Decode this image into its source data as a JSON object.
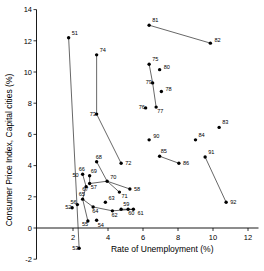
{
  "chart_data": {
    "type": "scatter",
    "title": "",
    "xlabel": "Rate of Unemployment (%)",
    "ylabel": "Consumer Price Index, Capital cities (%)",
    "xlim": [
      0,
      12.6
    ],
    "ylim": [
      -2,
      14
    ],
    "xticks": [
      2,
      4,
      6,
      8,
      10,
      12
    ],
    "yticks": [
      -2,
      0,
      2,
      4,
      6,
      8,
      10,
      12,
      14
    ],
    "grid": false,
    "legend": null,
    "point_label_field": "year_two_digit",
    "points": [
      {
        "label": "51",
        "x": 1.75,
        "y": 12.2
      },
      {
        "label": "52",
        "x": 1.95,
        "y": 1.3
      },
      {
        "label": "53",
        "x": 2.35,
        "y": -1.3
      },
      {
        "label": "54",
        "x": 3.35,
        "y": 0.5
      },
      {
        "label": "55",
        "x": 2.85,
        "y": 0.45
      },
      {
        "label": "56",
        "x": 2.25,
        "y": 1.5
      },
      {
        "label": "57",
        "x": 2.95,
        "y": 2.85
      },
      {
        "label": "58",
        "x": 5.25,
        "y": 2.5
      },
      {
        "label": "59",
        "x": 4.75,
        "y": 1.2
      },
      {
        "label": "60",
        "x": 5.15,
        "y": 1.2
      },
      {
        "label": "61",
        "x": 5.45,
        "y": 1.2
      },
      {
        "label": "62",
        "x": 4.25,
        "y": 1.1
      },
      {
        "label": "63",
        "x": 3.85,
        "y": 1.65
      },
      {
        "label": "64",
        "x": 3.15,
        "y": 1.35
      },
      {
        "label": "65",
        "x": 2.55,
        "y": 1.85
      },
      {
        "label": "66",
        "x": 2.55,
        "y": 3.45
      },
      {
        "label": "67",
        "x": 2.75,
        "y": 2.65
      },
      {
        "label": "68",
        "x": 3.35,
        "y": 4.25
      },
      {
        "label": "69",
        "x": 2.95,
        "y": 3.35
      },
      {
        "label": "70",
        "x": 3.95,
        "y": 3.0
      },
      {
        "label": "71",
        "x": 4.65,
        "y": 2.3
      },
      {
        "label": "72",
        "x": 4.75,
        "y": 4.15
      },
      {
        "label": "73",
        "x": 3.35,
        "y": 7.3
      },
      {
        "label": "74",
        "x": 3.35,
        "y": 11.1
      },
      {
        "label": "75",
        "x": 6.35,
        "y": 10.5
      },
      {
        "label": "76",
        "x": 6.15,
        "y": 7.7
      },
      {
        "label": "77",
        "x": 6.75,
        "y": 7.75
      },
      {
        "label": "78",
        "x": 7.05,
        "y": 8.75
      },
      {
        "label": "79",
        "x": 6.55,
        "y": 9.3
      },
      {
        "label": "80",
        "x": 6.95,
        "y": 10.15
      },
      {
        "label": "81",
        "x": 6.35,
        "y": 13.0
      },
      {
        "label": "82",
        "x": 9.85,
        "y": 11.85
      },
      {
        "label": "83",
        "x": 10.35,
        "y": 6.45
      },
      {
        "label": "84",
        "x": 9.0,
        "y": 5.65
      },
      {
        "label": "85",
        "x": 6.95,
        "y": 4.6
      },
      {
        "label": "86",
        "x": 8.05,
        "y": 4.15
      },
      {
        "label": "90",
        "x": 6.35,
        "y": 5.65
      },
      {
        "label": "91",
        "x": 9.55,
        "y": 4.55
      },
      {
        "label": "92",
        "x": 10.75,
        "y": 1.65
      }
    ],
    "connector_paths": [
      [
        "51",
        "53"
      ],
      [
        "74",
        "73",
        "72"
      ],
      [
        "81",
        "82"
      ],
      [
        "75",
        "79",
        "77"
      ],
      [
        "85",
        "86"
      ],
      [
        "91",
        "92"
      ],
      [
        "66",
        "67",
        "65",
        "55"
      ],
      [
        "69",
        "57",
        "70",
        "58"
      ],
      [
        "68",
        "70",
        "71"
      ],
      [
        "65",
        "64",
        "62",
        "61"
      ],
      [
        "59",
        "60",
        "61"
      ],
      [
        "50",
        "66"
      ]
    ],
    "extra_labels": [
      {
        "label": "50",
        "x": 2.15,
        "y": 3.25
      }
    ]
  },
  "axes": {
    "x_tick_labels": [
      "2",
      "4",
      "6",
      "8",
      "10",
      "12"
    ],
    "y_tick_labels": [
      "-2",
      "0",
      "2",
      "4",
      "6",
      "8",
      "10",
      "12",
      "14"
    ]
  }
}
